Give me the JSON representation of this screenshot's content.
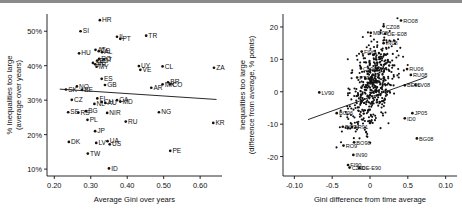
{
  "figure": {
    "background": "#ffffff",
    "point_color": "#111111",
    "top_rule_color": "#8a8a8a"
  },
  "chart_data": [
    {
      "type": "scatter",
      "panel": "left",
      "title": "",
      "xlabel": "Average Gini over years",
      "ylabel": "% Inequalities too large (average over years)",
      "xlabel_lines": [
        "Average Gini over years"
      ],
      "ylabel_lines": [
        "% Inequalities too large",
        "(average over years)"
      ],
      "xticks": [
        "0.20",
        "0.30",
        "0.40",
        "0.50",
        "0.60"
      ],
      "xtick_values": [
        0.2,
        0.3,
        0.4,
        0.5,
        0.6
      ],
      "yticks": [
        "10%",
        "20%",
        "30%",
        "40%",
        "50%"
      ],
      "ytick_values": [
        10,
        20,
        30,
        40,
        50
      ],
      "xlim": [
        0.18,
        0.66
      ],
      "ylim": [
        8,
        55
      ],
      "grid": false,
      "legend": "none",
      "fitline": {
        "x1": 0.215,
        "y1": 33.2,
        "x2": 0.645,
        "y2": 30.2
      },
      "points": [
        {
          "label": "HR",
          "x": 0.325,
          "y": 53.2
        },
        {
          "label": "SI",
          "x": 0.272,
          "y": 50.0
        },
        {
          "label": "IL",
          "x": 0.372,
          "y": 48.4
        },
        {
          "label": "PT",
          "x": 0.381,
          "y": 47.8
        },
        {
          "label": "TR",
          "x": 0.452,
          "y": 48.7
        },
        {
          "label": "AT",
          "x": 0.313,
          "y": 44.6
        },
        {
          "label": "DE",
          "x": 0.322,
          "y": 44.2
        },
        {
          "label": "AL",
          "x": 0.331,
          "y": 43.9
        },
        {
          "label": "HU",
          "x": 0.268,
          "y": 43.6
        },
        {
          "label": "RO",
          "x": 0.323,
          "y": 42.0
        },
        {
          "label": "IT",
          "x": 0.336,
          "y": 41.8
        },
        {
          "label": "BD",
          "x": 0.318,
          "y": 41.5
        },
        {
          "label": "SK",
          "x": 0.306,
          "y": 40.8
        },
        {
          "label": "FR",
          "x": 0.312,
          "y": 40.4
        },
        {
          "label": "MY",
          "x": 0.316,
          "y": 39.7
        },
        {
          "label": "ES",
          "x": 0.33,
          "y": 36.2
        },
        {
          "label": "GB",
          "x": 0.339,
          "y": 34.4
        },
        {
          "label": "UY",
          "x": 0.432,
          "y": 39.9
        },
        {
          "label": "VE",
          "x": 0.436,
          "y": 38.8
        },
        {
          "label": "CL",
          "x": 0.497,
          "y": 39.8
        },
        {
          "label": "ZA",
          "x": 0.638,
          "y": 39.4
        },
        {
          "label": "MX",
          "x": 0.497,
          "y": 34.6
        },
        {
          "label": "BR",
          "x": 0.512,
          "y": 35.2
        },
        {
          "label": "CO",
          "x": 0.518,
          "y": 34.6
        },
        {
          "label": "AR",
          "x": 0.466,
          "y": 33.6
        },
        {
          "label": "NO",
          "x": 0.262,
          "y": 34.0
        },
        {
          "label": "SK2",
          "x": 0.232,
          "y": 33.1
        },
        {
          "label": "BE",
          "x": 0.276,
          "y": 33.0
        },
        {
          "label": "CZ",
          "x": 0.248,
          "y": 30.1
        },
        {
          "label": "FI",
          "x": 0.318,
          "y": 30.5
        },
        {
          "label": "CA",
          "x": 0.372,
          "y": 30.0
        },
        {
          "label": "MD",
          "x": 0.381,
          "y": 29.6
        },
        {
          "label": "CH",
          "x": 0.33,
          "y": 29.5
        },
        {
          "label": "AU",
          "x": 0.34,
          "y": 29.2
        },
        {
          "label": "NL",
          "x": 0.31,
          "y": 28.9
        },
        {
          "label": "SE",
          "x": 0.238,
          "y": 26.5
        },
        {
          "label": "RS",
          "x": 0.266,
          "y": 26.4
        },
        {
          "label": "BG",
          "x": 0.287,
          "y": 26.8
        },
        {
          "label": "NIR",
          "x": 0.345,
          "y": 26.3
        },
        {
          "label": "NG",
          "x": 0.487,
          "y": 26.5
        },
        {
          "label": "PL",
          "x": 0.291,
          "y": 24.3
        },
        {
          "label": "RU",
          "x": 0.396,
          "y": 23.8
        },
        {
          "label": "KR",
          "x": 0.636,
          "y": 23.4
        },
        {
          "label": "JP",
          "x": 0.312,
          "y": 21.0
        },
        {
          "label": "DK",
          "x": 0.24,
          "y": 17.9
        },
        {
          "label": "LV",
          "x": 0.315,
          "y": 17.6
        },
        {
          "label": "UA",
          "x": 0.346,
          "y": 18.1
        },
        {
          "label": "US",
          "x": 0.352,
          "y": 17.2
        },
        {
          "label": "PE",
          "x": 0.518,
          "y": 15.3
        },
        {
          "label": "TW",
          "x": 0.292,
          "y": 14.5
        },
        {
          "label": "ID",
          "x": 0.35,
          "y": 10.2
        }
      ]
    },
    {
      "type": "scatter",
      "panel": "right",
      "title": "",
      "xlabel": "Gini difference from time average",
      "ylabel": "Inequalities too large (difference from average, % points)",
      "xlabel_lines": [
        "Gini difference from time average"
      ],
      "ylabel_lines": [
        "Inequalities too large",
        "(difference from average, % points)"
      ],
      "xticks": [
        "-0.10",
        "-0.5",
        "0",
        "0.5",
        "0.10"
      ],
      "xtick_values": [
        -0.1,
        -0.05,
        0,
        0.05,
        0.1
      ],
      "yticks": [
        "20",
        "10",
        "0",
        "-10",
        "-20"
      ],
      "ytick_values": [
        20,
        10,
        0,
        -10,
        -20
      ],
      "xlim": [
        -0.115,
        0.115
      ],
      "ylim": [
        -26,
        24
      ],
      "grid": false,
      "legend": "none",
      "fitline": {
        "x1": -0.082,
        "y1": -8.6,
        "x2": 0.075,
        "y2": 4.6
      },
      "labeled_points": [
        {
          "label": "RO08",
          "x": 0.041,
          "y": 22.0
        },
        {
          "label": "CZ08",
          "x": 0.018,
          "y": 20.2
        },
        {
          "label": "MD08",
          "x": 0.001,
          "y": 18.2
        },
        {
          "label": "DE-E08",
          "x": 0.02,
          "y": 17.9
        },
        {
          "label": "IN08",
          "x": 0.018,
          "y": 15.0
        },
        {
          "label": "FI96",
          "x": -0.011,
          "y": 12.4
        },
        {
          "label": "CL96",
          "x": -0.012,
          "y": 7.2
        },
        {
          "label": "PT99",
          "x": -0.017,
          "y": 4.4
        },
        {
          "label": "RU06",
          "x": 0.049,
          "y": 7.0
        },
        {
          "label": "RU08",
          "x": 0.054,
          "y": 5.2
        },
        {
          "label": "BE96",
          "x": 0.046,
          "y": 2.0
        },
        {
          "label": "LV08",
          "x": 0.06,
          "y": 2.1
        },
        {
          "label": "LV90",
          "x": -0.067,
          "y": -0.2
        },
        {
          "label": "BG96",
          "x": -0.044,
          "y": -6.6
        },
        {
          "label": "JP05",
          "x": 0.056,
          "y": -6.6
        },
        {
          "label": "ID02",
          "x": 0.046,
          "y": -8.2
        },
        {
          "label": "BG94",
          "x": -0.036,
          "y": -10.8
        },
        {
          "label": "AR91",
          "x": -0.024,
          "y": -10.9
        },
        {
          "label": "BG08",
          "x": 0.062,
          "y": -14.4
        },
        {
          "label": "BO98",
          "x": -0.021,
          "y": -15.6
        },
        {
          "label": "RO92",
          "x": -0.035,
          "y": -16.6
        },
        {
          "label": "IN90",
          "x": -0.022,
          "y": -19.5
        },
        {
          "label": "FI90",
          "x": -0.029,
          "y": -22.6
        },
        {
          "label": "CZ90",
          "x": -0.027,
          "y": -23.4
        },
        {
          "label": "DE-E90",
          "x": -0.014,
          "y": -23.6
        }
      ],
      "cloud_description": "dense black cluster of several hundred unlabeled country-year points concentrated between -0.03 and 0.05 on x and -12 to 16 on y"
    }
  ]
}
